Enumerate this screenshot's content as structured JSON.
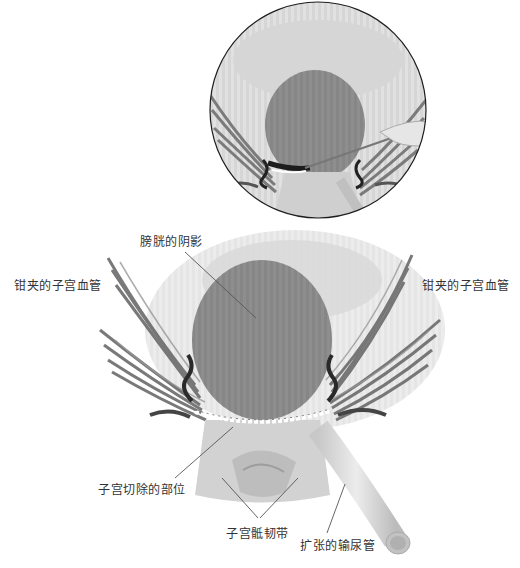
{
  "figure": {
    "title": "",
    "inset": {
      "description": "magnified view of incision with scalpel"
    },
    "labels": {
      "bladder_shadow": "膀胱的阴影",
      "clamped_vessels_left": "钳夹的子宫血管",
      "clamped_vessels_right": "钳夹的子宫血管",
      "hysterectomy_site": "子宫切除的部位",
      "uterosacral_ligament": "子宫骶韧带",
      "dilated_ureter": "扩张的输尿管"
    },
    "colors": {
      "background": "#ffffff",
      "tissue_light": "#e2e2e2",
      "tissue_mid": "#bdbdbd",
      "bladder_shadow": "#8c8c8c",
      "vessel_dark": "#5a5a5a",
      "clamp_black": "#222222",
      "label_text": "#333333",
      "leader_line": "#555555"
    }
  }
}
